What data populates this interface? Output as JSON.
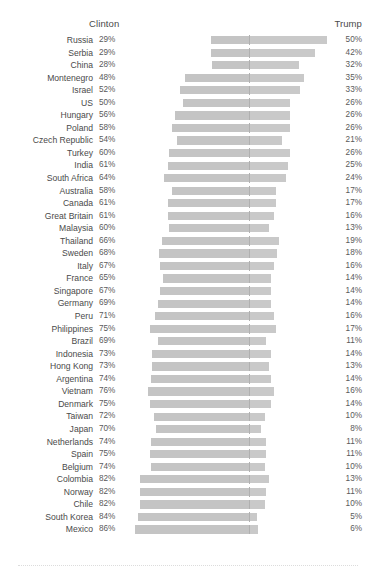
{
  "header": {
    "left_label": "Clinton",
    "right_label": "Trump"
  },
  "chart_data": {
    "type": "bar",
    "title": "",
    "subtitle": "",
    "xlabel": "",
    "ylabel": "",
    "orientation": "horizontal",
    "layout": "diverging",
    "grid": false,
    "legend_position": "top",
    "series": [
      {
        "name": "Clinton",
        "unit": "%"
      },
      {
        "name": "Trump",
        "unit": "%"
      }
    ],
    "categories": [
      "Russia",
      "Serbia",
      "China",
      "Montenegro",
      "Israel",
      "US",
      "Hungary",
      "Poland",
      "Czech Republic",
      "Turkey",
      "India",
      "South Africa",
      "Australia",
      "Canada",
      "Great Britain",
      "Malaysia",
      "Thailand",
      "Sweden",
      "Italy",
      "France",
      "Singapore",
      "Germany",
      "Peru",
      "Philippines",
      "Brazil",
      "Indonesia",
      "Hong Kong",
      "Argentina",
      "Vietnam",
      "Denmark",
      "Taiwan",
      "Japan",
      "Netherlands",
      "Spain",
      "Belgium",
      "Colombia",
      "Norway",
      "Chile",
      "South Korea",
      "Mexico"
    ],
    "clinton_values": [
      29,
      29,
      28,
      48,
      52,
      50,
      56,
      58,
      54,
      60,
      61,
      64,
      58,
      61,
      61,
      60,
      66,
      68,
      67,
      65,
      67,
      69,
      71,
      75,
      69,
      73,
      73,
      74,
      76,
      75,
      72,
      70,
      74,
      75,
      74,
      82,
      82,
      82,
      84,
      86
    ],
    "trump_values": [
      50,
      42,
      32,
      35,
      33,
      26,
      26,
      26,
      21,
      26,
      25,
      24,
      17,
      17,
      16,
      13,
      19,
      18,
      16,
      14,
      14,
      14,
      16,
      17,
      11,
      14,
      13,
      14,
      16,
      14,
      10,
      8,
      11,
      11,
      10,
      13,
      11,
      10,
      5,
      6
    ],
    "value_suffix": "%"
  },
  "rows": [
    {
      "country": "Russia",
      "clinton": "29%",
      "trump": "50%",
      "c": 29,
      "t": 50
    },
    {
      "country": "Serbia",
      "clinton": "29%",
      "trump": "42%",
      "c": 29,
      "t": 42
    },
    {
      "country": "China",
      "clinton": "28%",
      "trump": "32%",
      "c": 28,
      "t": 32
    },
    {
      "country": "Montenegro",
      "clinton": "48%",
      "trump": "35%",
      "c": 48,
      "t": 35
    },
    {
      "country": "Israel",
      "clinton": "52%",
      "trump": "33%",
      "c": 52,
      "t": 33
    },
    {
      "country": "US",
      "clinton": "50%",
      "trump": "26%",
      "c": 50,
      "t": 26
    },
    {
      "country": "Hungary",
      "clinton": "56%",
      "trump": "26%",
      "c": 56,
      "t": 26
    },
    {
      "country": "Poland",
      "clinton": "58%",
      "trump": "26%",
      "c": 58,
      "t": 26
    },
    {
      "country": "Czech Republic",
      "clinton": "54%",
      "trump": "21%",
      "c": 54,
      "t": 21
    },
    {
      "country": "Turkey",
      "clinton": "60%",
      "trump": "26%",
      "c": 60,
      "t": 26
    },
    {
      "country": "India",
      "clinton": "61%",
      "trump": "25%",
      "c": 61,
      "t": 25
    },
    {
      "country": "South Africa",
      "clinton": "64%",
      "trump": "24%",
      "c": 64,
      "t": 24
    },
    {
      "country": "Australia",
      "clinton": "58%",
      "trump": "17%",
      "c": 58,
      "t": 17
    },
    {
      "country": "Canada",
      "clinton": "61%",
      "trump": "17%",
      "c": 61,
      "t": 17
    },
    {
      "country": "Great Britain",
      "clinton": "61%",
      "trump": "16%",
      "c": 61,
      "t": 16
    },
    {
      "country": "Malaysia",
      "clinton": "60%",
      "trump": "13%",
      "c": 60,
      "t": 13
    },
    {
      "country": "Thailand",
      "clinton": "66%",
      "trump": "19%",
      "c": 66,
      "t": 19
    },
    {
      "country": "Sweden",
      "clinton": "68%",
      "trump": "18%",
      "c": 68,
      "t": 18
    },
    {
      "country": "Italy",
      "clinton": "67%",
      "trump": "16%",
      "c": 67,
      "t": 16
    },
    {
      "country": "France",
      "clinton": "65%",
      "trump": "14%",
      "c": 65,
      "t": 14
    },
    {
      "country": "Singapore",
      "clinton": "67%",
      "trump": "14%",
      "c": 67,
      "t": 14
    },
    {
      "country": "Germany",
      "clinton": "69%",
      "trump": "14%",
      "c": 69,
      "t": 14
    },
    {
      "country": "Peru",
      "clinton": "71%",
      "trump": "16%",
      "c": 71,
      "t": 16
    },
    {
      "country": "Philippines",
      "clinton": "75%",
      "trump": "17%",
      "c": 75,
      "t": 17
    },
    {
      "country": "Brazil",
      "clinton": "69%",
      "trump": "11%",
      "c": 69,
      "t": 11
    },
    {
      "country": "Indonesia",
      "clinton": "73%",
      "trump": "14%",
      "c": 73,
      "t": 14
    },
    {
      "country": "Hong Kong",
      "clinton": "73%",
      "trump": "13%",
      "c": 73,
      "t": 13
    },
    {
      "country": "Argentina",
      "clinton": "74%",
      "trump": "14%",
      "c": 74,
      "t": 14
    },
    {
      "country": "Vietnam",
      "clinton": "76%",
      "trump": "16%",
      "c": 76,
      "t": 16
    },
    {
      "country": "Denmark",
      "clinton": "75%",
      "trump": "14%",
      "c": 75,
      "t": 14
    },
    {
      "country": "Taiwan",
      "clinton": "72%",
      "trump": "10%",
      "c": 72,
      "t": 10
    },
    {
      "country": "Japan",
      "clinton": "70%",
      "trump": "8%",
      "c": 70,
      "t": 8
    },
    {
      "country": "Netherlands",
      "clinton": "74%",
      "trump": "11%",
      "c": 74,
      "t": 11
    },
    {
      "country": "Spain",
      "clinton": "75%",
      "trump": "11%",
      "c": 75,
      "t": 11
    },
    {
      "country": "Belgium",
      "clinton": "74%",
      "trump": "10%",
      "c": 74,
      "t": 10
    },
    {
      "country": "Colombia",
      "clinton": "82%",
      "trump": "13%",
      "c": 82,
      "t": 13
    },
    {
      "country": "Norway",
      "clinton": "82%",
      "trump": "11%",
      "c": 82,
      "t": 11
    },
    {
      "country": "Chile",
      "clinton": "82%",
      "trump": "10%",
      "c": 82,
      "t": 10
    },
    {
      "country": "South Korea",
      "clinton": "84%",
      "trump": "5%",
      "c": 84,
      "t": 5
    },
    {
      "country": "Mexico",
      "clinton": "86%",
      "trump": "6%",
      "c": 86,
      "t": 6
    }
  ],
  "colors": {
    "bar": "#c4c4c4",
    "text": "#4a4a4a",
    "divider": "#b0b0b0"
  }
}
